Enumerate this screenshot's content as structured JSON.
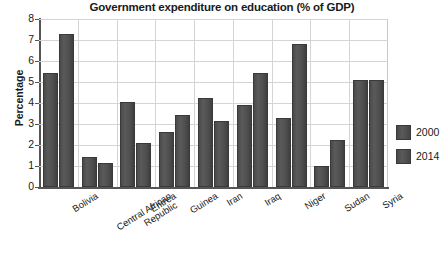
{
  "chart_data": {
    "type": "bar",
    "title": "Government expenditure on education (% of GDP)",
    "xlabel": "",
    "ylabel": "Percentage",
    "ylim": [
      0,
      8
    ],
    "yticks": [
      0,
      1,
      2,
      3,
      4,
      5,
      6,
      7,
      8
    ],
    "grid": true,
    "legend_position": "right",
    "categories": [
      "Bolivia",
      "Central African Republic",
      "Eritrea",
      "Guinea",
      "Iran",
      "Iraq",
      "Niger",
      "Sudan",
      "Syria"
    ],
    "category_lines": [
      [
        "Bolivia"
      ],
      [
        "Central African",
        "Republic"
      ],
      [
        "Eritrea"
      ],
      [
        "Guinea"
      ],
      [
        "Iran"
      ],
      [
        "Iraq"
      ],
      [
        "Niger"
      ],
      [
        "Sudan"
      ],
      [
        "Syria"
      ]
    ],
    "series": [
      {
        "name": "2000",
        "color": "#4d4d4d",
        "values": [
          5.45,
          1.45,
          4.05,
          2.6,
          4.25,
          3.9,
          3.3,
          1.0,
          5.1
        ]
      },
      {
        "name": "2014",
        "color": "#4d4d4d",
        "values": [
          7.3,
          1.15,
          2.1,
          3.45,
          3.15,
          5.45,
          6.8,
          2.25,
          5.1
        ]
      }
    ]
  },
  "legend": {
    "items": [
      {
        "label": "2000"
      },
      {
        "label": "2014"
      }
    ]
  },
  "bleed": {
    "text": ""
  }
}
